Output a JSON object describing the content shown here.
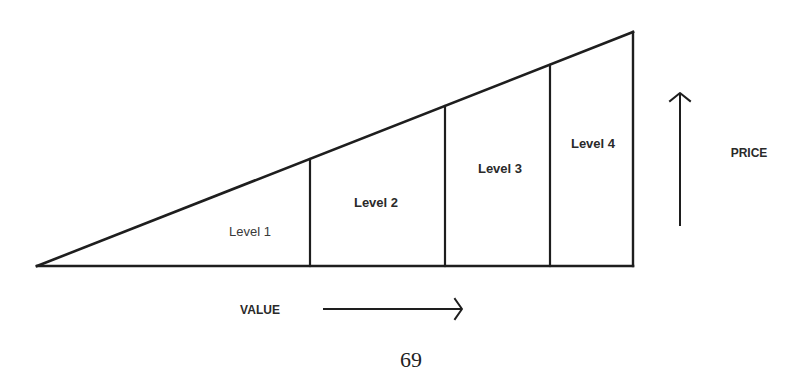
{
  "diagram": {
    "levels": [
      {
        "label": "Level 1"
      },
      {
        "label": "Level 2"
      },
      {
        "label": "Level 3"
      },
      {
        "label": "Level 4"
      }
    ],
    "axes": {
      "horizontal": {
        "label": "VALUE",
        "direction": "right-arrow"
      },
      "vertical": {
        "label": "PRICE",
        "direction": "up-arrow"
      }
    },
    "colors": {
      "line": "#1e1e1e",
      "text": "#2a2a2a",
      "background": "#ffffff"
    }
  },
  "page": {
    "number": "69"
  }
}
